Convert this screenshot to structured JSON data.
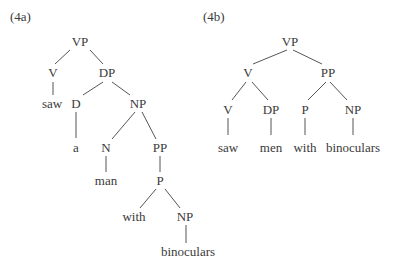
{
  "trees": [
    {
      "label": "(4a)",
      "label_pos": [
        10,
        10
      ],
      "nodes": [
        {
          "id": "a_vp",
          "text": "VP",
          "x": 80,
          "y": 42
        },
        {
          "id": "a_v",
          "text": "V",
          "x": 53,
          "y": 73
        },
        {
          "id": "a_dp",
          "text": "DP",
          "x": 107,
          "y": 73
        },
        {
          "id": "a_saw",
          "text": "saw",
          "x": 52,
          "y": 104
        },
        {
          "id": "a_d",
          "text": "D",
          "x": 76,
          "y": 104
        },
        {
          "id": "a_np1",
          "text": "NP",
          "x": 138,
          "y": 104
        },
        {
          "id": "a_a",
          "text": "a",
          "x": 76,
          "y": 148
        },
        {
          "id": "a_n",
          "text": "N",
          "x": 106,
          "y": 148
        },
        {
          "id": "a_pp",
          "text": "PP",
          "x": 160,
          "y": 148
        },
        {
          "id": "a_man",
          "text": "man",
          "x": 106,
          "y": 181
        },
        {
          "id": "a_p",
          "text": "P",
          "x": 160,
          "y": 181
        },
        {
          "id": "a_with",
          "text": "with",
          "x": 134,
          "y": 217
        },
        {
          "id": "a_np2",
          "text": "NP",
          "x": 185,
          "y": 217
        },
        {
          "id": "a_bin",
          "text": "binoculars",
          "x": 188,
          "y": 252
        }
      ],
      "edges": [
        [
          70,
          50,
          55,
          64
        ],
        [
          90,
          50,
          103,
          64
        ],
        [
          53,
          82,
          53,
          95
        ],
        [
          103,
          82,
          83,
          95
        ],
        [
          112,
          82,
          130,
          95
        ],
        [
          76,
          112,
          76,
          138
        ],
        [
          135,
          112,
          112,
          139
        ],
        [
          142,
          112,
          156,
          139
        ],
        [
          106,
          156,
          106,
          172
        ],
        [
          160,
          156,
          160,
          172
        ],
        [
          156,
          189,
          140,
          208
        ],
        [
          165,
          189,
          180,
          208
        ],
        [
          186,
          225,
          186,
          243
        ]
      ]
    },
    {
      "label": "(4b)",
      "label_pos": [
        203,
        10
      ],
      "nodes": [
        {
          "id": "b_vp",
          "text": "VP",
          "x": 290,
          "y": 42
        },
        {
          "id": "b_v1",
          "text": "V",
          "x": 248,
          "y": 73
        },
        {
          "id": "b_pp",
          "text": "PP",
          "x": 328,
          "y": 73
        },
        {
          "id": "b_v2",
          "text": "V",
          "x": 228,
          "y": 110
        },
        {
          "id": "b_dp",
          "text": "DP",
          "x": 271,
          "y": 110
        },
        {
          "id": "b_p",
          "text": "P",
          "x": 305,
          "y": 110
        },
        {
          "id": "b_np",
          "text": "NP",
          "x": 353,
          "y": 110
        },
        {
          "id": "b_saw",
          "text": "saw",
          "x": 228,
          "y": 148
        },
        {
          "id": "b_men",
          "text": "men",
          "x": 271,
          "y": 148
        },
        {
          "id": "b_with",
          "text": "with",
          "x": 305,
          "y": 148
        },
        {
          "id": "b_bin",
          "text": "binoculars",
          "x": 353,
          "y": 148
        }
      ],
      "edges": [
        [
          287,
          50,
          253,
          64
        ],
        [
          293,
          50,
          322,
          64
        ],
        [
          246,
          82,
          232,
          100
        ],
        [
          252,
          82,
          268,
          100
        ],
        [
          326,
          82,
          308,
          100
        ],
        [
          330,
          82,
          347,
          100
        ],
        [
          228,
          118,
          228,
          135
        ],
        [
          271,
          118,
          271,
          135
        ],
        [
          305,
          118,
          305,
          135
        ],
        [
          353,
          118,
          353,
          135
        ]
      ]
    }
  ]
}
